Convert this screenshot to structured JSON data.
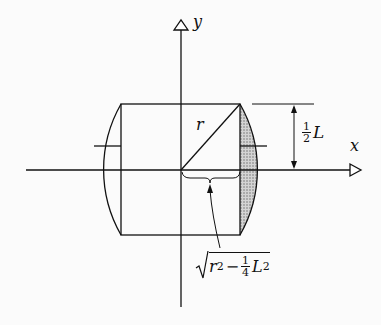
{
  "diagram": {
    "axes": {
      "x_label": "x",
      "y_label": "y"
    },
    "radius_label": "r",
    "half_length": {
      "numerator": "1",
      "denominator": "2",
      "symbol": "L"
    },
    "sqrt_label": {
      "r": "r",
      "r_exp": "2",
      "minus": "−",
      "numerator": "1",
      "denominator": "4",
      "L": "L",
      "L_exp": "2"
    },
    "colors": {
      "line": "#111111",
      "shade": "#b8b8b8",
      "background": "#fbfbfb"
    }
  }
}
